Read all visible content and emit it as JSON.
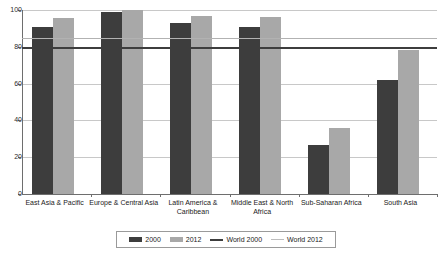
{
  "chart_data": {
    "type": "bar",
    "title": "",
    "xlabel": "",
    "ylabel": "",
    "ylim": [
      0,
      100
    ],
    "ytick_values": [
      0,
      20,
      40,
      60,
      80,
      100
    ],
    "ytick_labels": [
      "0",
      "20",
      "40",
      "60",
      "80",
      "100"
    ],
    "grid": true,
    "legend_position": "bottom",
    "categories": [
      "East Asia & Pacific",
      "Europe & Central Asia",
      "Latin America & Caribbean",
      "Middle East & North Africa",
      "Sub-Saharan Africa",
      "South Asia"
    ],
    "series": [
      {
        "name": "2000",
        "type": "bar",
        "color": "#3d3d3d",
        "values": [
          91,
          99,
          93,
          90.5,
          26.5,
          62
        ]
      },
      {
        "name": "2012",
        "type": "bar",
        "color": "#a8a8a8",
        "values": [
          95.5,
          100,
          96.5,
          96,
          36,
          78.5
        ]
      },
      {
        "name": "World 2000",
        "type": "reference-line",
        "color": "#3d3d3d",
        "value": 80
      },
      {
        "name": "World 2012",
        "type": "reference-line",
        "color": "#bdbdbd",
        "value": 85
      }
    ],
    "legend": [
      {
        "label": "2000",
        "marker": "bar",
        "color": "#3d3d3d"
      },
      {
        "label": "2012",
        "marker": "bar",
        "color": "#a8a8a8"
      },
      {
        "label": "World 2000",
        "marker": "line",
        "color": "#3d3d3d"
      },
      {
        "label": "World 2012",
        "marker": "line",
        "color": "#bdbdbd"
      }
    ]
  }
}
